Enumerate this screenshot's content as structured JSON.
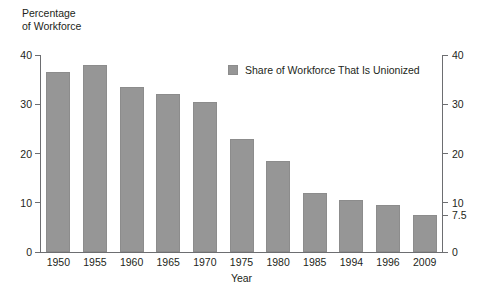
{
  "chart_data": {
    "type": "bar",
    "title": "",
    "ylabel": "Percentage\nof Workforce",
    "xlabel": "Year",
    "categories": [
      "1950",
      "1955",
      "1960",
      "1965",
      "1970",
      "1975",
      "1980",
      "1985",
      "1994",
      "1996",
      "2009"
    ],
    "values": [
      36.5,
      38,
      33.5,
      32,
      30.5,
      23,
      18.5,
      12,
      10.5,
      9.5,
      7.5
    ],
    "series": [
      {
        "name": "Share of Workforce That Is Unionized",
        "values": [
          36.5,
          38,
          33.5,
          32,
          30.5,
          23,
          18.5,
          12,
          10.5,
          9.5,
          7.5
        ]
      }
    ],
    "ylim": [
      0,
      40
    ],
    "yticks_left": [
      "40",
      "30",
      "20",
      "10",
      "0"
    ],
    "yticks_left_values": [
      40,
      30,
      20,
      10,
      0
    ],
    "yticks_right": [
      "40",
      "30",
      "20",
      "10",
      "7.5",
      "0"
    ],
    "yticks_right_values": [
      40,
      30,
      20,
      10,
      7.5,
      0
    ],
    "grid": false,
    "legend": {
      "position": "top-center",
      "entries": [
        "Share of Workforce That Is Unionized"
      ]
    },
    "bar_color": "#969696",
    "axis_color": "#6d6e71",
    "text_color": "#231f20",
    "background_color": "#ffffff"
  },
  "legend": {
    "label": "Share of Workforce That Is Unionized",
    "swatch_name": "legend-color-swatch"
  },
  "axes": {
    "y_title": "Percentage\nof Workforce",
    "x_title": "Year"
  }
}
